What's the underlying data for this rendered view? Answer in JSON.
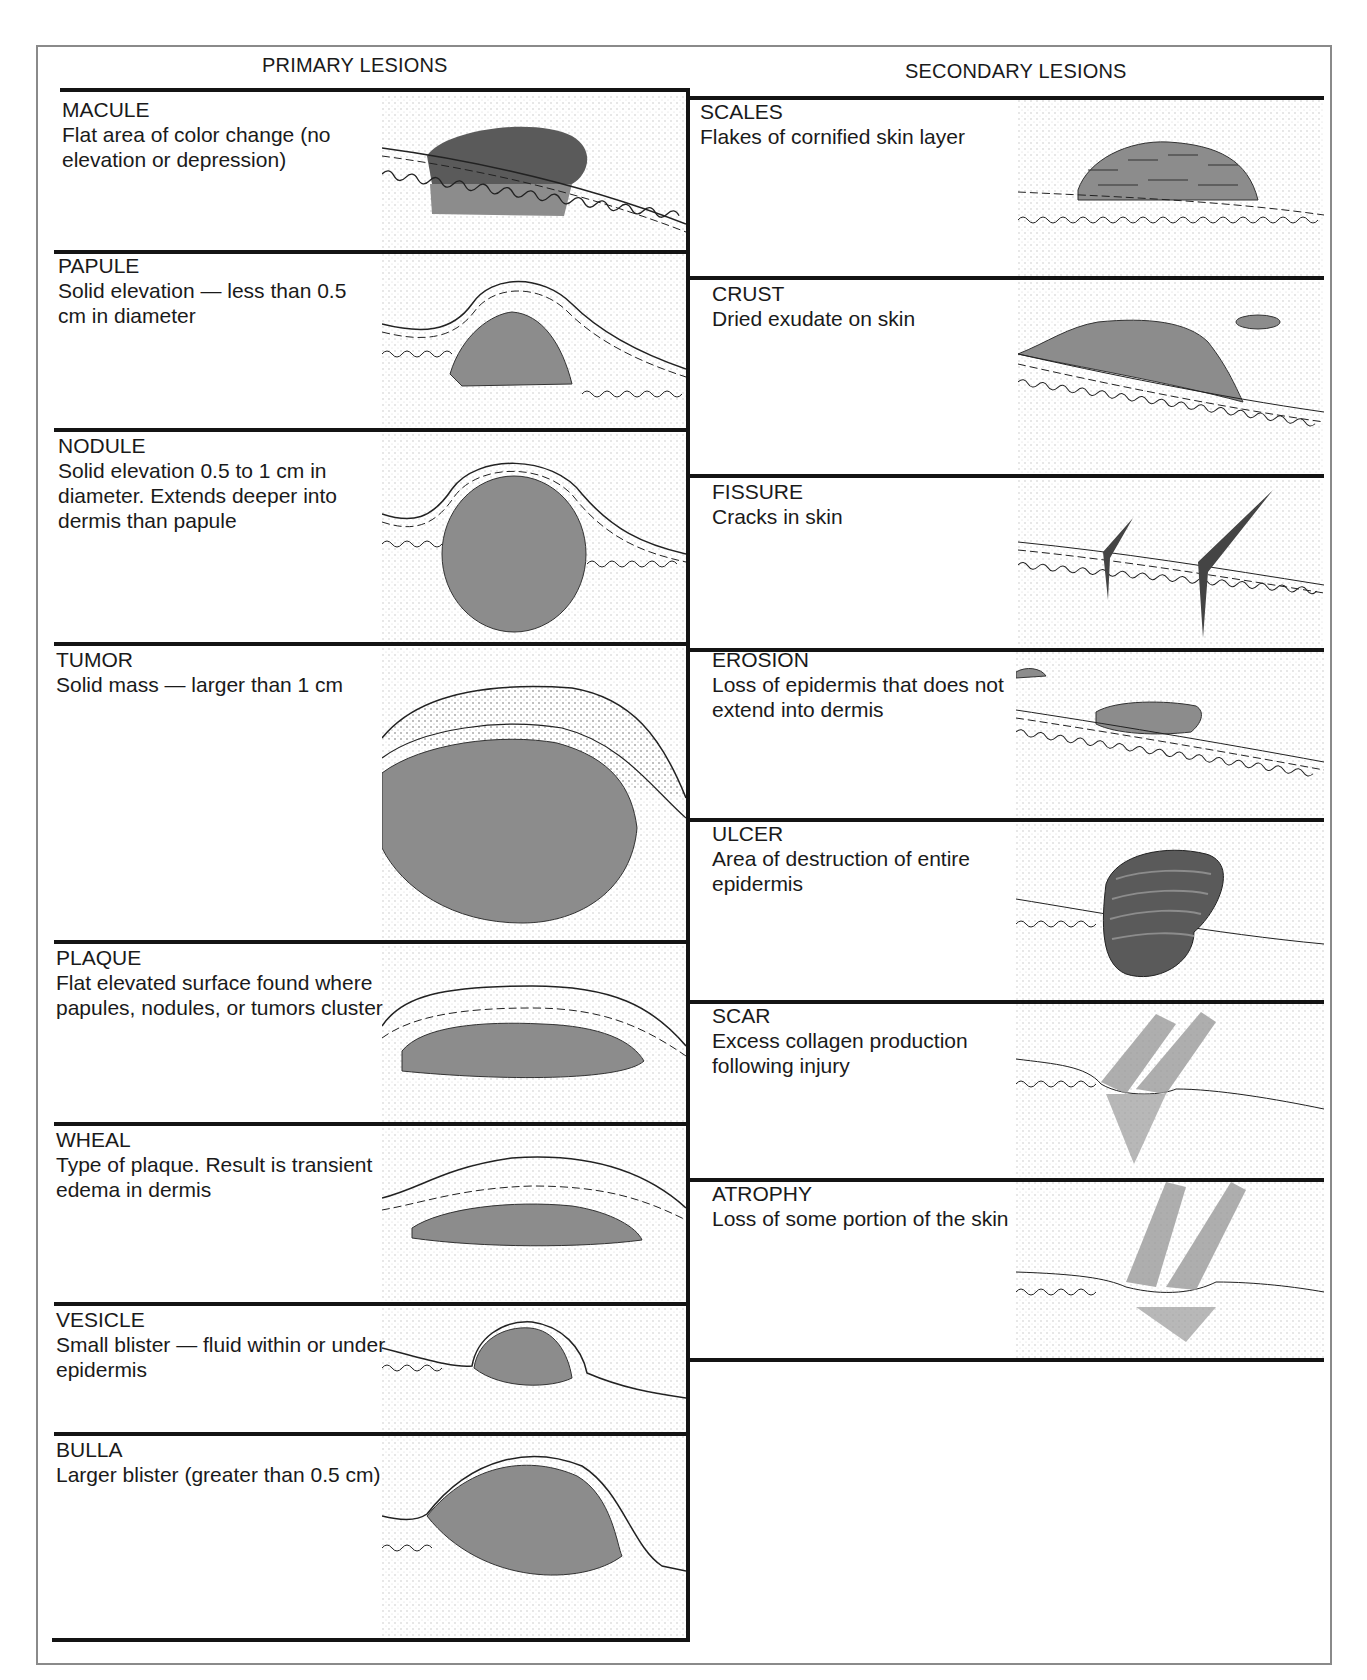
{
  "chart": {
    "columns": [
      {
        "title": "PRIMARY LESIONS"
      },
      {
        "title": "SECONDARY LESIONS"
      }
    ],
    "primary": [
      {
        "name": "MACULE",
        "description": "Flat area of color change (no elevation or depression)",
        "illustration": "macule-illustration"
      },
      {
        "name": "PAPULE",
        "description": "Solid elevation — less than 0.5 cm in diameter",
        "illustration": "papule-illustration"
      },
      {
        "name": "NODULE",
        "description": "Solid elevation 0.5 to 1 cm in diameter. Extends deeper into dermis than papule",
        "illustration": "nodule-illustration"
      },
      {
        "name": "TUMOR",
        "description": "Solid mass — larger than 1 cm",
        "illustration": "tumor-illustration"
      },
      {
        "name": "PLAQUE",
        "description": "Flat elevated surface found where papules, nodules, or tumors cluster",
        "illustration": "plaque-illustration"
      },
      {
        "name": "WHEAL",
        "description": "Type of plaque. Result is transient edema in dermis",
        "illustration": "wheal-illustration"
      },
      {
        "name": "VESICLE",
        "description": "Small blister — fluid within or under epidermis",
        "illustration": "vesicle-illustration"
      },
      {
        "name": "BULLA",
        "description": "Larger blister (greater than 0.5 cm)",
        "illustration": "bulla-illustration"
      }
    ],
    "secondary": [
      {
        "name": "SCALES",
        "description": "Flakes of cornified skin layer",
        "illustration": "scales-illustration"
      },
      {
        "name": "CRUST",
        "description": "Dried exudate on skin",
        "illustration": "crust-illustration"
      },
      {
        "name": "FISSURE",
        "description": "Cracks in skin",
        "illustration": "fissure-illustration"
      },
      {
        "name": "EROSION",
        "description": "Loss of epidermis that does not extend into dermis",
        "illustration": "erosion-illustration"
      },
      {
        "name": "ULCER",
        "description": "Area of destruction of entire epidermis",
        "illustration": "ulcer-illustration"
      },
      {
        "name": "SCAR",
        "description": "Excess collagen production following injury",
        "illustration": "scar-illustration"
      },
      {
        "name": "ATROPHY",
        "description": "Loss of some portion of the skin",
        "illustration": "atrophy-illustration"
      }
    ],
    "colors": {
      "lesion_fill": "#8c8c8c",
      "lesion_dark": "#5a5a5a",
      "rule": "#141414",
      "frame": "#8a8a8a"
    }
  }
}
